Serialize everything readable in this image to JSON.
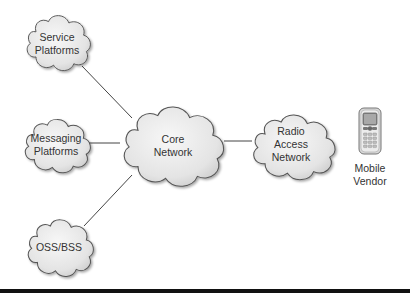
{
  "diagram": {
    "nodes": [
      {
        "id": "service-platforms",
        "lines": [
          "Service",
          "Platforms"
        ],
        "shape": "cloud"
      },
      {
        "id": "messaging-platforms",
        "lines": [
          "Messaging",
          "Platforms"
        ],
        "shape": "cloud"
      },
      {
        "id": "oss-bss",
        "lines": [
          "OSS/BSS"
        ],
        "shape": "cloud"
      },
      {
        "id": "core-network",
        "lines": [
          "Core",
          "Network"
        ],
        "shape": "cloud"
      },
      {
        "id": "radio-access-network",
        "lines": [
          "Radio",
          "Access",
          "Network"
        ],
        "shape": "cloud"
      },
      {
        "id": "mobile-vendor",
        "lines": [
          "Mobile",
          "Vendor"
        ],
        "shape": "mobile-phone-icon"
      }
    ],
    "edges": [
      {
        "from": "service-platforms",
        "to": "core-network"
      },
      {
        "from": "messaging-platforms",
        "to": "core-network"
      },
      {
        "from": "oss-bss",
        "to": "core-network"
      },
      {
        "from": "core-network",
        "to": "radio-access-network"
      }
    ],
    "labels": {
      "service_platforms": "Service\nPlatforms",
      "service_platforms_l1": "Service",
      "service_platforms_l2": "Platforms",
      "messaging_platforms_l1": "Messaging",
      "messaging_platforms_l2": "Platforms",
      "oss_bss": "OSS/BSS",
      "core_network_l1": "Core",
      "core_network_l2": "Network",
      "ran_l1": "Radio",
      "ran_l2": "Access",
      "ran_l3": "Network",
      "mobile_vendor_l1": "Mobile",
      "mobile_vendor_l2": "Vendor"
    },
    "colors": {
      "cloud_fill": "#e6e6e6",
      "cloud_stroke": "#555555",
      "line": "#444444",
      "text": "#333333",
      "bottom_rule": "#111111"
    }
  }
}
